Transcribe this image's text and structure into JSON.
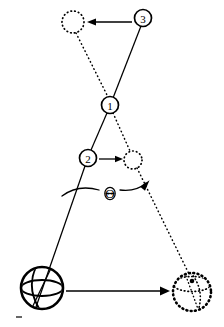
{
  "figure": {
    "width": 224,
    "height": 327,
    "background_color": "#ffffff",
    "ink_color": "#000000"
  },
  "labels": {
    "marker_1": "1",
    "marker_2": "2",
    "marker_3": "3",
    "angle_symbol": "Θ"
  },
  "markers": [
    {
      "id": "marker-1",
      "label": "1",
      "cx": 110,
      "cy": 105,
      "r": 8.5,
      "role": "pivot-intersection-point"
    },
    {
      "id": "marker-2",
      "label": "2",
      "cx": 88,
      "cy": 158,
      "r": 8.5,
      "role": "mid-rod-point"
    },
    {
      "id": "marker-3",
      "label": "3",
      "cx": 143,
      "cy": 18,
      "r": 8.5,
      "role": "rod-end-point"
    }
  ],
  "bodies": {
    "ball_initial": {
      "name": "ball-initial",
      "style": "solid",
      "cx": 42,
      "cy": 288,
      "r": 21,
      "stroke_width": 2.6
    },
    "ball_final": {
      "name": "ball-final",
      "style": "dotted",
      "cx": 192,
      "cy": 292,
      "r": 19,
      "stroke_width": 2.6
    }
  },
  "ghost_circles": [
    {
      "id": "ghost-circle-top",
      "cx": 73,
      "cy": 22,
      "r": 11,
      "style": "dotted",
      "paired_marker": "3"
    },
    {
      "id": "ghost-circle-mid",
      "cx": 133,
      "cy": 160,
      "r": 9,
      "style": "dotted",
      "paired_marker": "2"
    }
  ],
  "lines": {
    "rod_initial": {
      "name": "rod-initial-solid",
      "style": "solid",
      "points": "143,18 110,105 88,158 42,288"
    },
    "rod_final": {
      "name": "rod-final-dotted",
      "style": "dotted",
      "points": "73,22 110,105 133,160 192,292"
    }
  },
  "arrows": [
    {
      "id": "arrow-3-to-ghost-top",
      "direction": "left",
      "from": {
        "x": 132,
        "y": 22
      },
      "to": {
        "x": 88,
        "y": 22
      },
      "describes": "movement of point 3 to its rotated position"
    },
    {
      "id": "arrow-2-to-ghost-mid",
      "direction": "right",
      "from": {
        "x": 99,
        "y": 159
      },
      "to": {
        "x": 122,
        "y": 159
      },
      "describes": "movement of point 2 to its rotated position"
    },
    {
      "id": "arrow-ball-translation",
      "direction": "right",
      "from": {
        "x": 66,
        "y": 291
      },
      "to": {
        "x": 168,
        "y": 291
      },
      "describes": "translation of the ball to its new position"
    },
    {
      "id": "arrow-angle-theta",
      "direction": "curved-right",
      "from": {
        "x": 62,
        "y": 196
      },
      "to": {
        "x": 148,
        "y": 182
      },
      "describes": "rotation sweep through angle Theta"
    }
  ]
}
